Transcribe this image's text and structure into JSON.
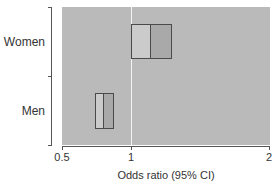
{
  "chart_data": {
    "type": "bar",
    "subtype": "forest-plot-boxes",
    "title": "",
    "xlabel": "Odds ratio (95% CI)",
    "ylabel": "",
    "xscale": "linear",
    "xlim": [
      0.5,
      2
    ],
    "xticks": [
      0.5,
      1,
      2
    ],
    "xtick_labels": [
      "0.5",
      "1",
      "2"
    ],
    "reference_line": 1,
    "grid": false,
    "categories": [
      "Women",
      "Men"
    ],
    "series": [
      {
        "name": "Odds ratio",
        "values": [
          1.14,
          0.8
        ]
      },
      {
        "name": "CI lower",
        "values": [
          1.0,
          0.74
        ]
      },
      {
        "name": "CI upper",
        "values": [
          1.3,
          0.88
        ]
      }
    ],
    "colors": {
      "plot_background": "#bababa",
      "lower_half": "#cbcbcb",
      "upper_half": "#a9a9a9",
      "box_border": "#4a4a4a",
      "reference_line": "#f4f4f4"
    }
  },
  "labels": {
    "women": "Women",
    "men": "Men",
    "x_tick_0": "0.5",
    "x_tick_1": "1",
    "x_tick_2": "2",
    "x_axis_title": "Odds ratio (95% CI)"
  }
}
